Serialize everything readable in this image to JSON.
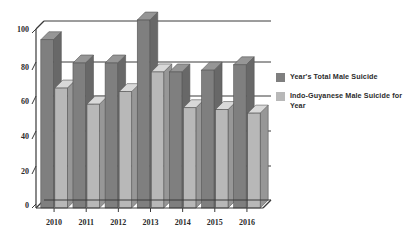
{
  "chart_data": {
    "type": "bar",
    "title": "",
    "subtitle": "",
    "xlabel": "",
    "ylabel": "",
    "categories": [
      "2010",
      "2011",
      "2012",
      "2013",
      "2014",
      "2015",
      "2016"
    ],
    "series": [
      {
        "name": "Year's Total Male Suicide",
        "color": "#7f7f7f",
        "values": [
          94,
          81,
          81,
          105,
          76,
          77,
          80
        ]
      },
      {
        "name": "Indo-Guyanese Male Suicide for Year",
        "color": "#b8b8b8",
        "values": [
          67,
          58,
          65,
          76,
          56,
          55,
          53
        ]
      }
    ],
    "ylim": [
      0,
      110
    ],
    "yticks": [
      0,
      20,
      40,
      60,
      80,
      100
    ],
    "ytick_labels": [
      "0",
      "20",
      "40",
      "60",
      "80",
      "100"
    ],
    "grid": true,
    "grid_axis": "y",
    "legend_position": "right",
    "style": "3d-perspective-bars"
  },
  "legend": {
    "entries": [
      {
        "label": "Year's Total Male Suicide",
        "swatch": "series-dark"
      },
      {
        "label": "Indo-Guyanese Male Suicide for Year",
        "swatch": "series-light"
      }
    ]
  },
  "axis": {
    "y_ticks": [
      "100",
      "80",
      "60",
      "40",
      "20",
      "0"
    ],
    "x_ticks": [
      "2010",
      "2011",
      "2012",
      "2013",
      "2014",
      "2015",
      "2016"
    ]
  },
  "colors": {
    "series_total": "#7f7f7f",
    "series_indo": "#b8b8b8",
    "axis": "#3a3a3a",
    "grid": "#3a3a3a",
    "background": "#ffffff"
  }
}
